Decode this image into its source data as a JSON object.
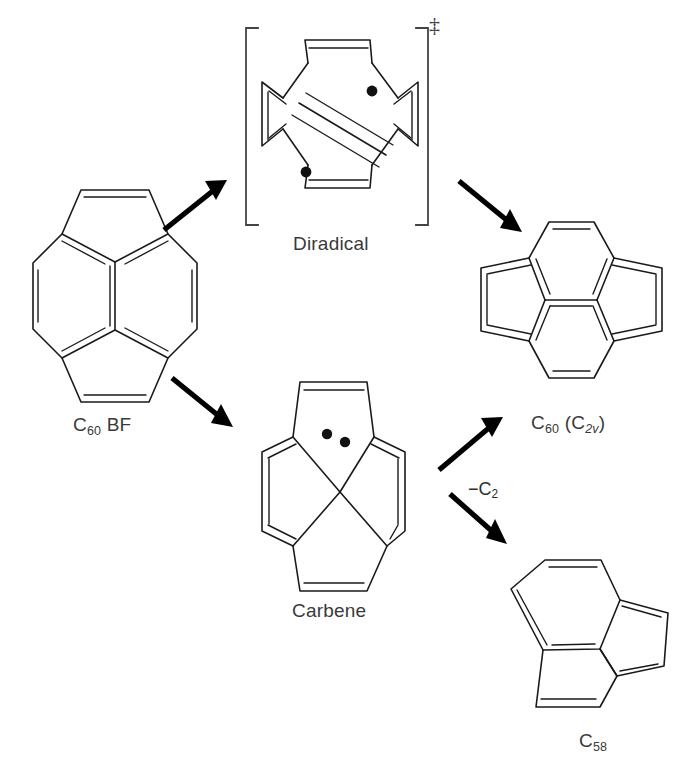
{
  "figure": {
    "kind": "chemical-reaction-scheme",
    "background_color": "#ffffff",
    "bond_color": "#1a1a1a",
    "label_color": "#3a3a3a",
    "arrow_color": "#000000"
  },
  "species": {
    "reactant": {
      "id": "c60bf",
      "label_html": "C<sub>60</sub> BF",
      "label_text": "C60 BF",
      "name": "C60 BF",
      "structure": "pyracylene-bowl-fragment"
    },
    "transition_state": {
      "id": "diradical",
      "label_html": "Diradical",
      "label_text": "Diradical",
      "name": "Diradical",
      "bracket": true,
      "dagger_symbol": "‡",
      "radical_dots": 2,
      "structure": "ring-opened-alkyne-diradical"
    },
    "intermediate": {
      "id": "carbene",
      "label_html": "Carbene",
      "label_text": "Carbene",
      "name": "Carbene",
      "carbene_dots": 2,
      "structure": "spiro-crossed-carbene"
    },
    "product_main": {
      "id": "c60-c2v",
      "label_html": "C<sub>60</sub> (C<sub><span class=\"ital\">2v</span></sub>)",
      "label_text": "C60 (C2v)",
      "name": "C60 (C2v)",
      "structure": "fused-bicyclic-rearranged"
    },
    "product_loss": {
      "id": "c58",
      "label_html": "C<sub>58</sub>",
      "label_text": "C58",
      "name": "C58",
      "structure": "azulene-like-seven-five-five"
    }
  },
  "arrows": [
    {
      "id": "arrow-reactant-to-diradical",
      "from": "C60 BF",
      "to": "Diradical",
      "label": "",
      "direction": "up-right"
    },
    {
      "id": "arrow-diradical-to-c60",
      "from": "Diradical",
      "to": "C60 (C2v)",
      "label": "",
      "direction": "down-right"
    },
    {
      "id": "arrow-reactant-to-carbene",
      "from": "C60 BF",
      "to": "Carbene",
      "label": "",
      "direction": "down-right"
    },
    {
      "id": "arrow-carbene-to-c60",
      "from": "Carbene",
      "to": "C60 (C2v)",
      "label": "",
      "direction": "up-right"
    },
    {
      "id": "arrow-carbene-to-c58",
      "from": "Carbene",
      "to": "C58",
      "label_html": "−C<sub>2</sub>",
      "label_text": "-C2",
      "direction": "down-right"
    }
  ]
}
